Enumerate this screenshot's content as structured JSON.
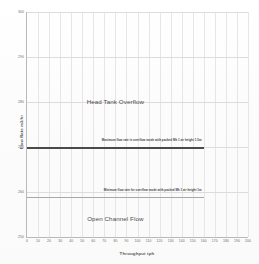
{
  "chart_data": {
    "type": "line",
    "title": "",
    "xlabel": "Throughput tph",
    "ylabel": "Flow Rate m3/hr",
    "xlim": [
      0,
      200
    ],
    "ylim": [
      250,
      300
    ],
    "grid": true,
    "legend": "none",
    "xticks": [
      0,
      10,
      20,
      30,
      40,
      50,
      60,
      70,
      80,
      90,
      100,
      110,
      120,
      130,
      140,
      150,
      160,
      170,
      180,
      190,
      200
    ],
    "yticks": [
      250,
      260,
      270,
      280,
      290,
      300
    ],
    "x": [
      0,
      160
    ],
    "series": [
      {
        "name": "Maximum flow rate in overflow mode with packed Mk 1 air height 1.5m",
        "values": [
          270,
          270
        ],
        "color": "#4a4a4a",
        "style": "thick"
      },
      {
        "name": "Minimum flow rate for overflow mode with packed Mk 1 air height 1m",
        "values": [
          259,
          259
        ],
        "color": "#a8a8a8",
        "style": "thin"
      }
    ],
    "annotations": [
      {
        "text": "Head Tank Overflow",
        "x": 80,
        "y": 281,
        "kind": "region-label"
      },
      {
        "text": "Open Channel Flow",
        "x": 80,
        "y": 255,
        "kind": "region-label"
      },
      {
        "text": "Maximum flow rate in overflow mode with packed Mk 1 air height 1.5m",
        "x": 158,
        "y": 272,
        "kind": "line-caption"
      },
      {
        "text": "Minimum flow rate for overflow mode with packed Mk 1 air height 1m",
        "x": 158,
        "y": 261,
        "kind": "line-caption"
      }
    ]
  }
}
